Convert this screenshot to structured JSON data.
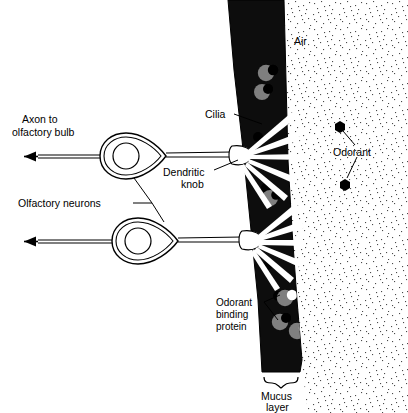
{
  "figure": {
    "width": 408,
    "height": 413,
    "background_color": "#ffffff"
  },
  "colors": {
    "mucus_layer": "#0d0d0d",
    "binding_protein": "#7f7f7f",
    "odorant": "#000000",
    "cilia": "#ffffff",
    "air_stipple": "#4a4a4a",
    "outline": "#000000"
  },
  "labels": {
    "axon": "Axon to\nolfactory bulb",
    "axon_line1": "Axon to",
    "axon_line2": "olfactory bulb",
    "olfactory_neurons": "Olfactory neurons",
    "cilia": "Cilia",
    "dendritic_knob_line1": "Dendritic",
    "dendritic_knob_line2": "knob",
    "air": "Air",
    "odorant": "Odorant",
    "odorant_binding_protein_line1": "Odorant",
    "odorant_binding_protein_line2": "binding",
    "odorant_binding_protein_line3": "protein",
    "mucus_layer_line1": "Mucus",
    "mucus_layer_line2": "layer"
  },
  "structures": {
    "neurons": [
      {
        "name": "upper-olfactory-neuron",
        "soma_cx": 124,
        "soma_cy": 155,
        "nucleus_cx": 124,
        "nucleus_cy": 155,
        "knob_cx": 238,
        "knob_cy": 155
      },
      {
        "name": "lower-olfactory-neuron",
        "soma_cx": 136,
        "soma_cy": 240,
        "nucleus_cx": 136,
        "nucleus_cy": 240,
        "knob_cx": 248,
        "knob_cy": 240
      }
    ],
    "cilia_count_per_knob": 6,
    "binding_proteins": [
      {
        "cx": 266,
        "cy": 73
      },
      {
        "cx": 262,
        "cy": 92
      },
      {
        "cx": 270,
        "cy": 198
      },
      {
        "cx": 285,
        "cy": 298
      },
      {
        "cx": 280,
        "cy": 322
      },
      {
        "cx": 296,
        "cy": 330
      }
    ],
    "odorants_in_mucus": [
      {
        "cx": 273,
        "cy": 70
      },
      {
        "cx": 268,
        "cy": 89
      },
      {
        "cx": 258,
        "cy": 137
      },
      {
        "cx": 266,
        "cy": 188
      },
      {
        "cx": 276,
        "cy": 195
      },
      {
        "cx": 268,
        "cy": 265
      },
      {
        "cx": 278,
        "cy": 296
      },
      {
        "cx": 286,
        "cy": 318
      }
    ],
    "odorants_in_air": [
      {
        "cx": 340,
        "cy": 127,
        "label": "Odorant"
      },
      {
        "cx": 345,
        "cy": 185,
        "label": "Odorant"
      }
    ]
  }
}
